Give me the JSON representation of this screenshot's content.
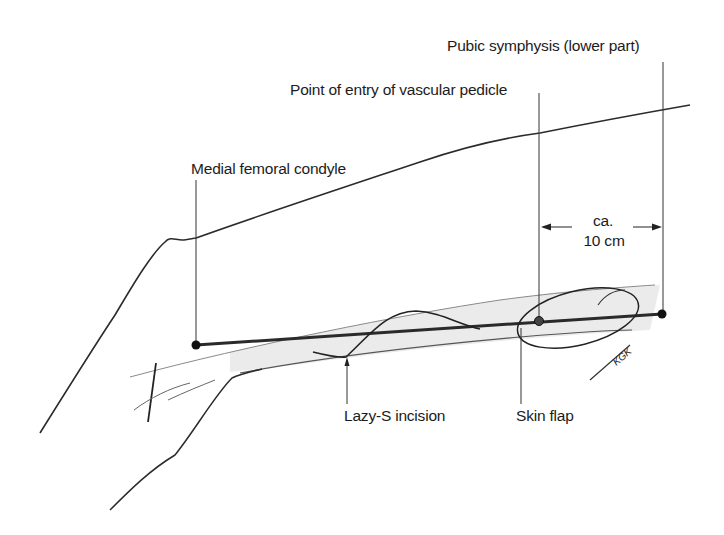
{
  "diagram": {
    "labels": {
      "pubic_symphysis": "Pubic symphysis (lower part)",
      "vascular_pedicle": "Point of entry of  vascular pedicle",
      "medial_condyle": "Medial femoral condyle",
      "distance_line1": "ca.",
      "distance_line2": "10 cm",
      "lazy_s": "Lazy-S incision",
      "skin_flap": "Skin flap",
      "signature": "KGK"
    },
    "colors": {
      "ink": "#1c1c1c",
      "axis_line": "#2a2a2a",
      "shading": "#d8d8d8",
      "background": "#ffffff"
    },
    "landmarks": [
      {
        "name": "Medial femoral condyle",
        "x": 196,
        "y": 345
      },
      {
        "name": "Point of entry of vascular pedicle",
        "x": 539,
        "y": 321
      },
      {
        "name": "Pubic symphysis (lower part)",
        "x": 662,
        "y": 314
      }
    ],
    "measurement": {
      "from": "vascular pedicle",
      "to": "pubic symphysis",
      "value": "ca. 10 cm"
    }
  }
}
